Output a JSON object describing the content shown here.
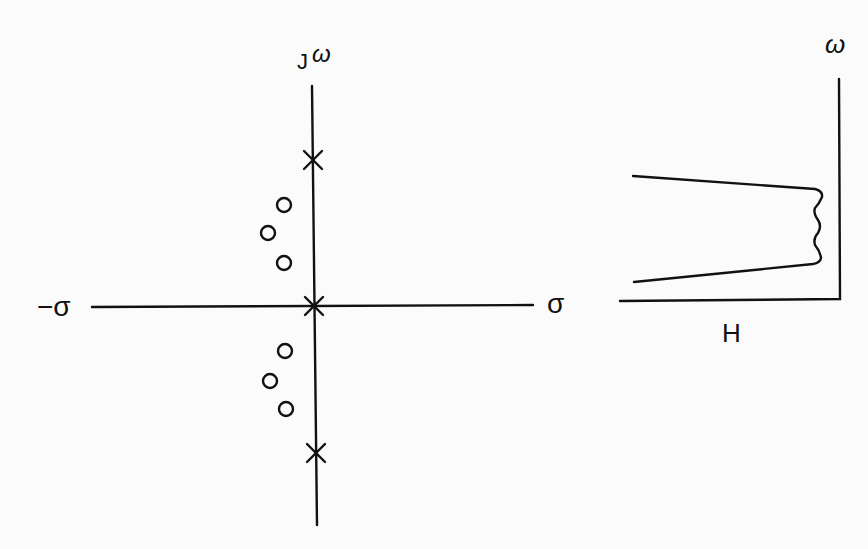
{
  "pole_zero_plot": {
    "labels": {
      "imag_axis_j": "J",
      "imag_axis_omega": "ω",
      "neg_real_axis": "−σ",
      "pos_real_axis": "σ"
    },
    "poles": [
      {
        "x": 313,
        "y": 160
      },
      {
        "x": 314,
        "y": 306
      },
      {
        "x": 316,
        "y": 453
      }
    ],
    "zeros": [
      {
        "x": 284,
        "y": 205
      },
      {
        "x": 268,
        "y": 233
      },
      {
        "x": 284,
        "y": 263
      },
      {
        "x": 285,
        "y": 351
      },
      {
        "x": 270,
        "y": 381
      },
      {
        "x": 286,
        "y": 409
      }
    ]
  },
  "response_plot": {
    "labels": {
      "vertical_axis": "ω",
      "horizontal_axis": "H"
    }
  },
  "colors": {
    "ink": "#111111",
    "paper": "#fbfbfb"
  }
}
